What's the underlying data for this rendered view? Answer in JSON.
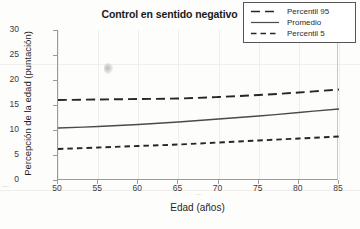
{
  "chart_data": {
    "type": "line",
    "title": "Control en sentido negativo",
    "xlabel": "Edad (años)",
    "ylabel": "Percepción de la edad (puntación)",
    "xlim": [
      50,
      85
    ],
    "ylim": [
      0,
      30
    ],
    "xticks": [
      50,
      55,
      60,
      65,
      70,
      75,
      80,
      85
    ],
    "yticks": [
      0,
      5,
      10,
      15,
      20,
      25,
      30
    ],
    "grid": "vertical-only",
    "legend_position": "top-right",
    "x": [
      50,
      55,
      60,
      65,
      70,
      75,
      80,
      85
    ],
    "series": [
      {
        "name": "Percentil 95",
        "style": "dashed-long",
        "color": "#262626",
        "values": [
          16.0,
          16.1,
          16.2,
          16.3,
          16.6,
          17.0,
          17.5,
          18.1
        ]
      },
      {
        "name": "Promedio",
        "style": "solid",
        "color": "#4a4a4a",
        "values": [
          10.4,
          10.7,
          11.1,
          11.6,
          12.2,
          12.8,
          13.5,
          14.2
        ]
      },
      {
        "name": "Percentil 5",
        "style": "dashed-short",
        "color": "#262626",
        "values": [
          6.2,
          6.5,
          6.8,
          7.1,
          7.5,
          7.9,
          8.3,
          8.7
        ]
      }
    ]
  },
  "legend": {
    "items": [
      {
        "label": "Percentil 95"
      },
      {
        "label": "Promedio"
      },
      {
        "label": "Percentil 5"
      }
    ]
  }
}
